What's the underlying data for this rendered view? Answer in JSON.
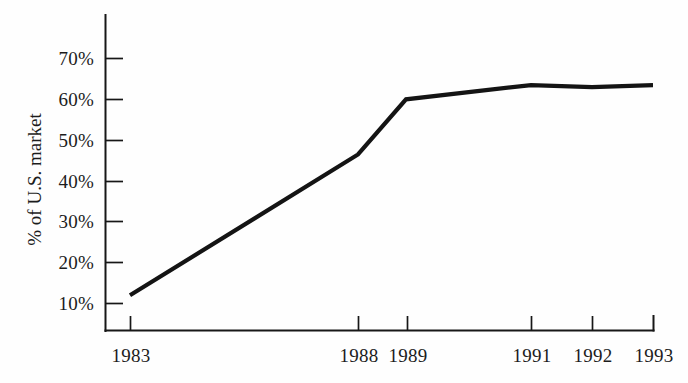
{
  "chart_data": {
    "type": "line",
    "title": "",
    "subtitle": "",
    "xlabel": "",
    "ylabel": "% of U.S. market",
    "x": [
      "1983",
      "1988",
      "1989",
      "1991",
      "1992",
      "1993"
    ],
    "categories": [
      "1983",
      "1988",
      "1989",
      "1991",
      "1992",
      "1993"
    ],
    "values": [
      12,
      46.5,
      60,
      63.5,
      63,
      63.5
    ],
    "series": [
      {
        "name": "% of U.S. market",
        "values": [
          12,
          46.5,
          60,
          63.5,
          63,
          63.5
        ]
      }
    ],
    "ylim": [
      0,
      75
    ],
    "yticks": [
      10,
      20,
      30,
      40,
      50,
      60,
      70
    ],
    "ytick_labels": [
      "10%",
      "20%",
      "30%",
      "40%",
      "50%",
      "60%",
      "70%"
    ],
    "xtick_labels": [
      "1983",
      "1988",
      "1989",
      "1991",
      "1992",
      "1993"
    ],
    "grid": false,
    "legend": false,
    "legend_position": "none",
    "line_color": "#141414",
    "background_color": "#fefefe",
    "axis_color": "#171717"
  },
  "axis": {
    "y_title": "% of U.S. market",
    "y_ticks": [
      {
        "label": "70%"
      },
      {
        "label": "60%"
      },
      {
        "label": "50%"
      },
      {
        "label": "40%"
      },
      {
        "label": "30%"
      },
      {
        "label": "20%"
      },
      {
        "label": "10%"
      }
    ],
    "x_ticks": [
      {
        "label": "1983"
      },
      {
        "label": "1988"
      },
      {
        "label": "1989"
      },
      {
        "label": "1991"
      },
      {
        "label": "1992"
      },
      {
        "label": "1993"
      }
    ]
  }
}
